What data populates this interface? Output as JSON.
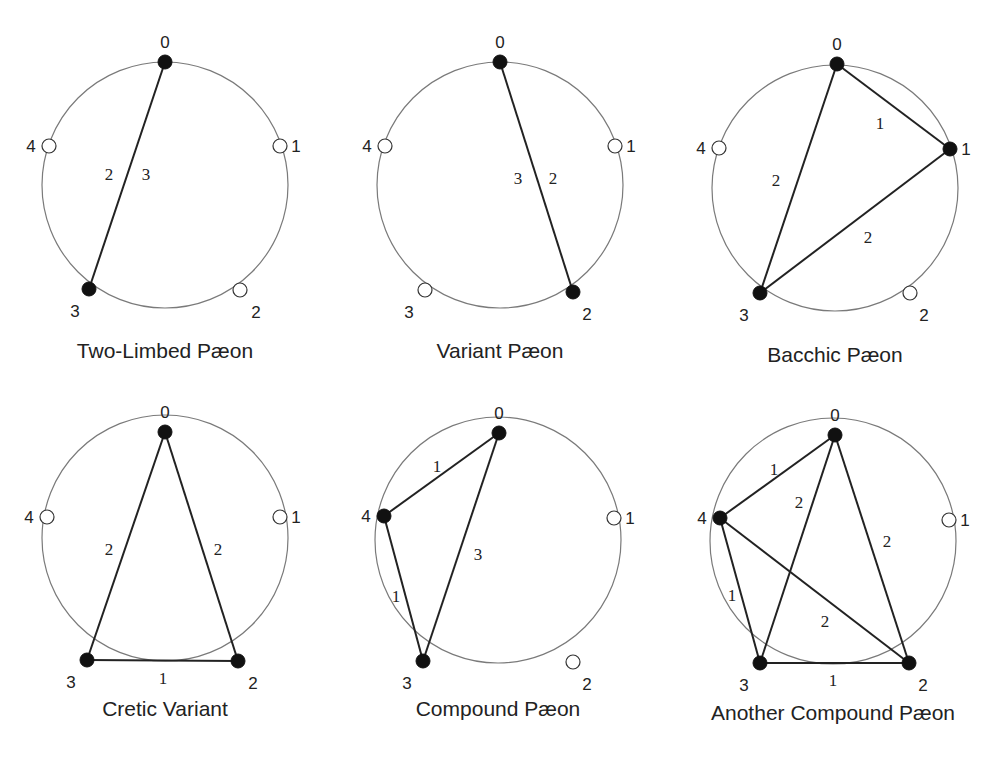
{
  "diagrams": [
    {
      "title": "Two-Limbed Pæon",
      "center": [
        165,
        185
      ],
      "r": 123,
      "caption_y": 358,
      "nodes": {
        "0": [
          165,
          62
        ],
        "1": [
          280,
          146
        ],
        "2": [
          240,
          290
        ],
        "3": [
          89,
          289
        ],
        "4": [
          49,
          146
        ]
      },
      "filled": [
        "0",
        "3"
      ],
      "edges": [
        {
          "from": "0",
          "to": "3",
          "labels": [
            {
              "text": "2",
              "x": 109,
              "y": 180
            },
            {
              "text": "3",
              "x": 146,
              "y": 180
            }
          ]
        }
      ],
      "label_offsets": {
        "0": [
          0,
          -14
        ],
        "1": [
          16,
          6
        ],
        "2": [
          16,
          28
        ],
        "3": [
          -14,
          28
        ],
        "4": [
          -18,
          6
        ]
      }
    },
    {
      "title": "Variant Pæon",
      "center": [
        500,
        185
      ],
      "r": 123,
      "caption_y": 358,
      "nodes": {
        "0": [
          500,
          62
        ],
        "1": [
          615,
          146
        ],
        "2": [
          573,
          292
        ],
        "3": [
          425,
          290
        ],
        "4": [
          385,
          146
        ]
      },
      "filled": [
        "0",
        "2"
      ],
      "edges": [
        {
          "from": "0",
          "to": "2",
          "labels": [
            {
              "text": "3",
              "x": 518,
              "y": 184
            },
            {
              "text": "2",
              "x": 553,
              "y": 184
            }
          ]
        }
      ],
      "label_offsets": {
        "0": [
          0,
          -14
        ],
        "1": [
          16,
          6
        ],
        "2": [
          14,
          28
        ],
        "3": [
          -16,
          28
        ],
        "4": [
          -18,
          6
        ]
      }
    },
    {
      "title": "Bacchic Pæon",
      "center": [
        835,
        188
      ],
      "r": 123,
      "caption_y": 362,
      "nodes": {
        "0": [
          837,
          64
        ],
        "1": [
          950,
          149
        ],
        "2": [
          910,
          293
        ],
        "3": [
          760,
          293
        ],
        "4": [
          719,
          148
        ]
      },
      "filled": [
        "0",
        "1",
        "3"
      ],
      "edges": [
        {
          "from": "0",
          "to": "1",
          "labels": [
            {
              "text": "1",
              "x": 880,
              "y": 129
            }
          ]
        },
        {
          "from": "0",
          "to": "3",
          "labels": [
            {
              "text": "2",
              "x": 776,
              "y": 186
            }
          ]
        },
        {
          "from": "1",
          "to": "3",
          "labels": [
            {
              "text": "2",
              "x": 868,
              "y": 243
            }
          ]
        }
      ],
      "label_offsets": {
        "0": [
          0,
          -14
        ],
        "1": [
          16,
          6
        ],
        "2": [
          14,
          28
        ],
        "3": [
          -16,
          28
        ],
        "4": [
          -18,
          6
        ]
      }
    },
    {
      "title": "Cretic Variant",
      "center": [
        165,
        538
      ],
      "r": 123,
      "caption_y": 716,
      "nodes": {
        "0": [
          165,
          432
        ],
        "1": [
          280,
          517
        ],
        "2": [
          238,
          661
        ],
        "3": [
          87,
          660
        ],
        "4": [
          47,
          517
        ]
      },
      "filled": [
        "0",
        "2",
        "3"
      ],
      "edges": [
        {
          "from": "0",
          "to": "3",
          "labels": [
            {
              "text": "2",
              "x": 109,
              "y": 555
            }
          ]
        },
        {
          "from": "0",
          "to": "2",
          "labels": [
            {
              "text": "2",
              "x": 218,
              "y": 555
            }
          ]
        },
        {
          "from": "3",
          "to": "2",
          "labels": [
            {
              "text": "1",
              "x": 163,
              "y": 684
            }
          ]
        }
      ],
      "label_offsets": {
        "0": [
          0,
          -14
        ],
        "1": [
          16,
          6
        ],
        "2": [
          15,
          28
        ],
        "3": [
          -16,
          28
        ],
        "4": [
          -18,
          6
        ]
      }
    },
    {
      "title": "Compound Pæon",
      "center": [
        498,
        540
      ],
      "r": 123,
      "caption_y": 716,
      "nodes": {
        "0": [
          499,
          433
        ],
        "1": [
          614,
          518
        ],
        "2": [
          573,
          662
        ],
        "3": [
          423,
          661
        ],
        "4": [
          384,
          516
        ]
      },
      "filled": [
        "0",
        "3",
        "4"
      ],
      "edges": [
        {
          "from": "4",
          "to": "0",
          "labels": [
            {
              "text": "1",
              "x": 437,
              "y": 472
            }
          ]
        },
        {
          "from": "0",
          "to": "3",
          "labels": [
            {
              "text": "3",
              "x": 478,
              "y": 560
            }
          ]
        },
        {
          "from": "4",
          "to": "3",
          "labels": [
            {
              "text": "1",
              "x": 396,
              "y": 602
            }
          ]
        }
      ],
      "label_offsets": {
        "0": [
          0,
          -14
        ],
        "1": [
          16,
          6
        ],
        "2": [
          14,
          28
        ],
        "3": [
          -16,
          28
        ],
        "4": [
          -18,
          6
        ]
      }
    },
    {
      "title": "Another Compound Pæon",
      "center": [
        833,
        541
      ],
      "r": 123,
      "caption_y": 720,
      "nodes": {
        "0": [
          835,
          435
        ],
        "1": [
          949,
          520
        ],
        "2": [
          909,
          663
        ],
        "3": [
          760,
          663
        ],
        "4": [
          720,
          518
        ]
      },
      "filled": [
        "0",
        "2",
        "3",
        "4"
      ],
      "edges": [
        {
          "from": "4",
          "to": "0",
          "labels": [
            {
              "text": "1",
              "x": 774,
              "y": 475
            }
          ]
        },
        {
          "from": "0",
          "to": "3",
          "labels": [
            {
              "text": "2",
              "x": 799,
              "y": 508
            }
          ]
        },
        {
          "from": "0",
          "to": "2",
          "labels": [
            {
              "text": "2",
              "x": 887,
              "y": 547
            }
          ]
        },
        {
          "from": "4",
          "to": "3",
          "labels": [
            {
              "text": "1",
              "x": 732,
              "y": 601
            }
          ]
        },
        {
          "from": "4",
          "to": "2",
          "labels": [
            {
              "text": "2",
              "x": 825,
              "y": 627
            }
          ]
        },
        {
          "from": "3",
          "to": "2",
          "labels": [
            {
              "text": "1",
              "x": 833,
              "y": 686
            }
          ]
        }
      ],
      "label_offsets": {
        "0": [
          0,
          -14
        ],
        "1": [
          16,
          6
        ],
        "2": [
          14,
          28
        ],
        "3": [
          -16,
          28
        ],
        "4": [
          -18,
          6
        ]
      }
    }
  ]
}
